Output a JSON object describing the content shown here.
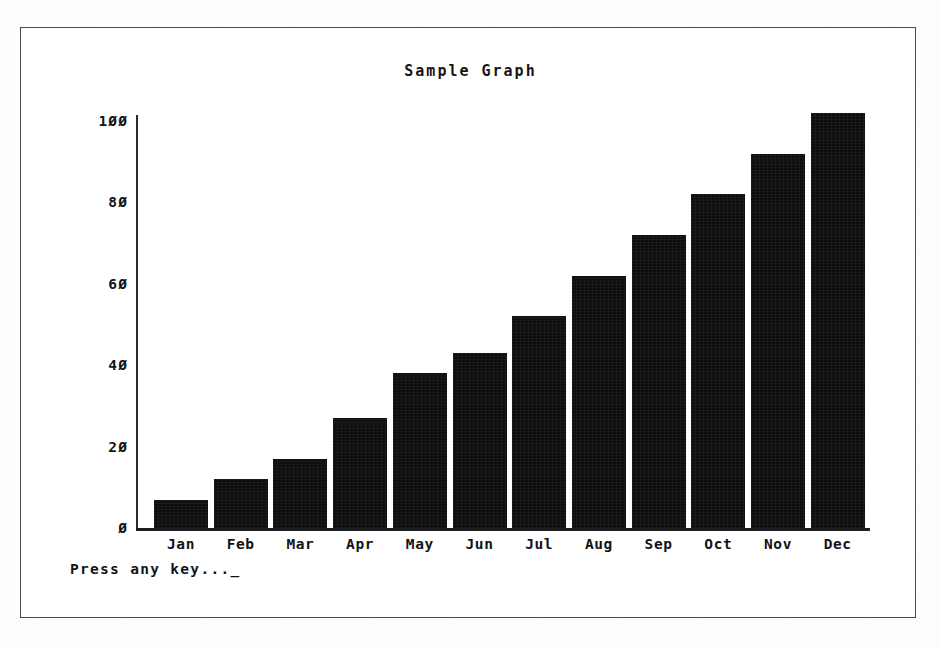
{
  "screen": {
    "prompt_text": "Press any key...",
    "cursor_glyph": "_"
  },
  "chart_data": {
    "type": "bar",
    "title": "Sample Graph",
    "xlabel": "",
    "ylabel": "",
    "categories": [
      "Jan",
      "Feb",
      "Mar",
      "Apr",
      "May",
      "Jun",
      "Jul",
      "Aug",
      "Sep",
      "Oct",
      "Nov",
      "Dec"
    ],
    "values": [
      7,
      12,
      17,
      27,
      38,
      43,
      52,
      62,
      72,
      82,
      92,
      102
    ],
    "ylim": [
      0,
      110
    ],
    "yticks": [
      0,
      20,
      40,
      60,
      80,
      100
    ],
    "ytick_labels": [
      "Ø",
      "2Ø",
      "4Ø",
      "6Ø",
      "8Ø",
      "1ØØ"
    ],
    "grid": false,
    "legend": false,
    "bar_color": "#0e0e10",
    "axis_color": "#1d1e21"
  }
}
